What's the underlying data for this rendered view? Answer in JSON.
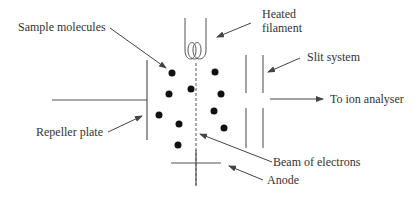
{
  "diagram": {
    "type": "electron-ionisation-source",
    "labels": {
      "sample_molecules": "Sample molecules",
      "heated_filament_line1": "Heated",
      "heated_filament_line2": "filament",
      "slit_system": "Slit system",
      "to_ion_analyser": "To ion analyser",
      "repeller_plate": "Repeller plate",
      "beam_of_electrons": "Beam of electrons",
      "anode": "Anode"
    },
    "colors": {
      "line": "#555555",
      "dot": "#111111",
      "text": "#333333",
      "background": "#ffffff"
    }
  }
}
